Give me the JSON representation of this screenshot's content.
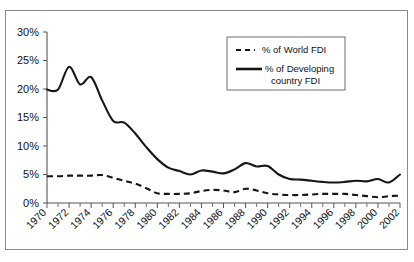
{
  "chart_data": {
    "type": "line",
    "title": "",
    "xlabel": "",
    "ylabel": "",
    "xlim": [
      1970,
      2002
    ],
    "ylim": [
      0,
      30
    ],
    "grid": false,
    "legend_position": "top-center-right",
    "ytick_labels": [
      "0%",
      "5%",
      "10%",
      "15%",
      "20%",
      "25%",
      "30%"
    ],
    "ytick_values": [
      0,
      5,
      10,
      15,
      20,
      25,
      30
    ],
    "xtick_labels": [
      "1970",
      "1972",
      "1974",
      "1976",
      "1978",
      "1980",
      "1982",
      "1984",
      "1986",
      "1988",
      "1990",
      "1992",
      "1994",
      "1996",
      "1998",
      "2000",
      "2002"
    ],
    "xtick_values": [
      1970,
      1972,
      1974,
      1976,
      1978,
      1980,
      1982,
      1984,
      1986,
      1988,
      1990,
      1992,
      1994,
      1996,
      1998,
      2000,
      2002
    ],
    "x": [
      1970,
      1971,
      1972,
      1973,
      1974,
      1975,
      1976,
      1977,
      1978,
      1979,
      1980,
      1981,
      1982,
      1983,
      1984,
      1985,
      1986,
      1987,
      1988,
      1989,
      1990,
      1991,
      1992,
      1993,
      1994,
      1995,
      1996,
      1997,
      1998,
      1999,
      2000,
      2001,
      2002
    ],
    "series": [
      {
        "name": "% of World FDI",
        "style": "dashed",
        "color": "#161616",
        "values": [
          4.7,
          4.7,
          4.8,
          4.8,
          4.8,
          4.9,
          4.4,
          3.9,
          3.4,
          2.6,
          1.7,
          1.6,
          1.6,
          1.7,
          2.1,
          2.3,
          2.2,
          1.9,
          2.5,
          2.2,
          1.7,
          1.5,
          1.4,
          1.4,
          1.5,
          1.6,
          1.6,
          1.6,
          1.4,
          1.2,
          1.0,
          1.2,
          1.3
        ]
      },
      {
        "name": "% of Developing country FDI",
        "style": "solid",
        "color": "#161616",
        "values": [
          19.9,
          19.9,
          23.9,
          20.8,
          22.1,
          18.0,
          14.4,
          14.1,
          12.2,
          9.8,
          7.7,
          6.2,
          5.6,
          5.0,
          5.7,
          5.5,
          5.2,
          5.9,
          7.0,
          6.4,
          6.5,
          5.0,
          4.2,
          4.1,
          3.9,
          3.7,
          3.6,
          3.7,
          3.9,
          3.8,
          4.2,
          3.6,
          5.0
        ]
      }
    ],
    "legend_entries": [
      {
        "label": "% of World FDI",
        "style": "dashed"
      },
      {
        "label": "% of Developing",
        "label2": "country FDI",
        "style": "solid"
      }
    ]
  },
  "legend": {
    "entry1_line1": "% of World FDI",
    "entry2_line1": "% of Developing",
    "entry2_line2": "country FDI"
  }
}
